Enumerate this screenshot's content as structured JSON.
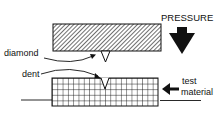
{
  "diagram": {
    "labels": {
      "pressure": "PRESSURE",
      "diamond": "diamond",
      "dent": "dent",
      "test_line1": "test",
      "test_line2": "material"
    },
    "colors": {
      "ink": "#111111",
      "background": "#ffffff"
    },
    "components": [
      {
        "id": "indenter-block",
        "fill": "diagonal-hatch"
      },
      {
        "id": "diamond-tip",
        "shape": "triangle-down"
      },
      {
        "id": "test-material-block",
        "fill": "grid"
      },
      {
        "id": "pressure-arrow",
        "direction": "down"
      },
      {
        "id": "material-arrow",
        "direction": "left"
      }
    ]
  }
}
